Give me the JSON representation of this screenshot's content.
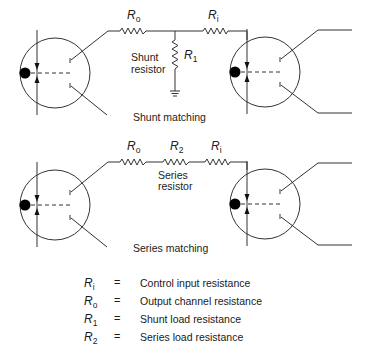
{
  "diagram": {
    "shunt_section": {
      "caption": "Shunt matching",
      "resistor_label_line1": "Shunt",
      "resistor_label_line2": "resistor",
      "symbols": {
        "ro": {
          "base": "R",
          "sub": "o"
        },
        "ri": {
          "base": "R",
          "sub": "i"
        },
        "r1": {
          "base": "R",
          "sub": "1"
        }
      }
    },
    "series_section": {
      "caption": "Series matching",
      "resistor_label_line1": "Series",
      "resistor_label_line2": "resistor",
      "symbols": {
        "ro": {
          "base": "R",
          "sub": "o"
        },
        "r2": {
          "base": "R",
          "sub": "2"
        },
        "ri": {
          "base": "R",
          "sub": "i"
        }
      }
    },
    "legend": [
      {
        "base": "R",
        "sub": "i",
        "eq": "=",
        "desc": "Control input resistance"
      },
      {
        "base": "R",
        "sub": "o",
        "eq": "=",
        "desc": "Output channel resistance"
      },
      {
        "base": "R",
        "sub": "1",
        "eq": "=",
        "desc": "Shunt load resistance"
      },
      {
        "base": "R",
        "sub": "2",
        "eq": "=",
        "desc": "Series load resistance"
      }
    ],
    "colors": {
      "line": "#333333",
      "background": "#ffffff"
    }
  }
}
